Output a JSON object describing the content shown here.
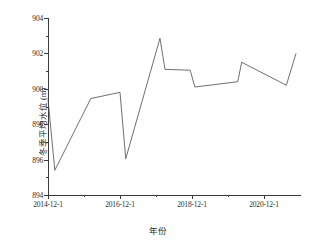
{
  "chart_data": {
    "type": "line",
    "title": "",
    "xlabel": "年份",
    "ylabel": "冬季平均水位 (m)",
    "xlim": [
      "2014-12-1",
      "2021-06-1"
    ],
    "ylim": [
      894,
      904
    ],
    "ytick_labels": [
      "894",
      "896",
      "898",
      "900",
      "902",
      "904"
    ],
    "ytick_values": [
      894,
      896,
      898,
      900,
      902,
      904
    ],
    "yminor_values": [
      895,
      897,
      899,
      901,
      903
    ],
    "xtick_labels": [
      "2014-12-1",
      "2016-12-1",
      "2018-12-1",
      "2020-12-1"
    ],
    "xtick_values": [
      2014.92,
      2016.92,
      2018.92,
      2020.92
    ],
    "xminor_values": [
      2015.92,
      2017.92,
      2019.92
    ],
    "grid": false,
    "legend": null,
    "series": [
      {
        "name": "冬季平均水位",
        "color": "#4a4a4a",
        "x": [
          2014.92,
          2015.11,
          2016.11,
          2016.92,
          2017.08,
          2018.03,
          2018.17,
          2018.87,
          2019.0,
          2020.19,
          2020.3,
          2021.54,
          2021.81
        ],
        "y": [
          899.4,
          895.4,
          899.45,
          899.8,
          896.05,
          902.85,
          901.1,
          901.05,
          900.1,
          900.4,
          901.5,
          900.2,
          902.0
        ]
      }
    ]
  },
  "figure": {
    "background": "#ffffff",
    "axis_color": "#3a3a3a",
    "text_color": "#1f1f1f"
  }
}
